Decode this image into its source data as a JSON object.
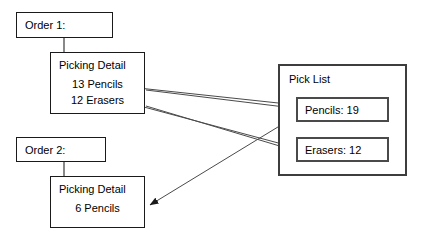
{
  "diagram": {
    "background_color": "#ffffff",
    "stroke_color": "#1a1a1a",
    "text_color": "#000000",
    "nodes": {
      "order_1": {
        "label": "Order 1:",
        "x": 16,
        "y": 12,
        "w": 97,
        "h": 26
      },
      "picking_detail_1": {
        "title": "Picking Detail",
        "line_1": "13 Pencils",
        "line_2": "12 Erasers",
        "x": 50,
        "y": 52,
        "w": 95,
        "h": 62
      },
      "order_2": {
        "label": "Order 2:",
        "x": 16,
        "y": 137,
        "w": 90,
        "h": 25
      },
      "picking_detail_2": {
        "title": "Picking Detail",
        "line_1": "6 Pencils",
        "x": 50,
        "y": 176,
        "w": 95,
        "h": 52
      },
      "pick_list": {
        "title": "Pick List",
        "x": 278,
        "y": 64,
        "w": 129,
        "h": 112,
        "items": [
          {
            "label": "Pencils: 19",
            "x": 296,
            "y": 97,
            "w": 93,
            "h": 25
          },
          {
            "label": "Erasers: 12",
            "x": 296,
            "y": 137,
            "w": 93,
            "h": 25
          }
        ]
      }
    },
    "connectors": [
      {
        "name": "order-1-to-picking-detail-1",
        "kind": "elbow",
        "from": [
          64,
          38
        ],
        "to": [
          64,
          52
        ]
      },
      {
        "name": "order-2-to-picking-detail-2",
        "kind": "elbow",
        "from": [
          64,
          162
        ],
        "to": [
          64,
          176
        ]
      }
    ],
    "arrows": [
      {
        "name": "pencils-19-to-13-pencils",
        "from": [
          296,
          105
        ],
        "to": [
          127,
          87
        ]
      },
      {
        "name": "erasers-12-to-12-erasers",
        "from": [
          296,
          148
        ],
        "to": [
          127,
          103
        ]
      },
      {
        "name": "13-pencils-to-pencils-19",
        "from": [
          146,
          90
        ],
        "to": [
          294,
          108
        ]
      },
      {
        "name": "12-erasers-to-erasers-12",
        "from": [
          146,
          106
        ],
        "to": [
          294,
          150
        ]
      },
      {
        "name": "pencils-19-to-6-pencils",
        "from": [
          290,
          118
        ],
        "to": [
          148,
          204
        ]
      }
    ]
  }
}
